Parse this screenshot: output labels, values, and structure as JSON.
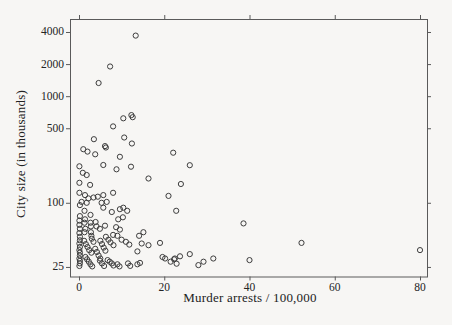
{
  "figure": {
    "x_axis_title": "Murder arrests / 100,000",
    "y_axis_title": "City size (in thousands)"
  },
  "chart_data": {
    "type": "scatter",
    "title": "",
    "xlabel": "Murder arrests / 100,000",
    "ylabel": "City size (in thousands)",
    "x_scale": "linear",
    "y_scale": "log",
    "xlim": [
      -2,
      82
    ],
    "ylim": [
      21,
      5300
    ],
    "xticks": [
      0,
      20,
      40,
      60,
      80
    ],
    "yticks": [
      25,
      100,
      500,
      1000,
      2000,
      4000
    ],
    "grid": false,
    "legend": "none",
    "marker": "open-circle",
    "ink_color": "#3d3d3d",
    "axis_color": "#5a5a5a",
    "background_color": "#f7f6f4",
    "points": [
      [
        13.3,
        3700
      ],
      [
        7.3,
        1900
      ],
      [
        4.6,
        1330
      ],
      [
        10.4,
        620
      ],
      [
        12.3,
        665
      ],
      [
        12.6,
        635
      ],
      [
        8.0,
        520
      ],
      [
        10.6,
        410
      ],
      [
        3.5,
        395
      ],
      [
        6.1,
        340
      ],
      [
        6.3,
        330
      ],
      [
        12.4,
        360
      ],
      [
        1.0,
        318
      ],
      [
        2.0,
        302
      ],
      [
        3.8,
        285
      ],
      [
        9.6,
        270
      ],
      [
        22.1,
        295
      ],
      [
        0.1,
        220
      ],
      [
        5.7,
        226
      ],
      [
        8.8,
        206
      ],
      [
        12.2,
        218
      ],
      [
        0.9,
        191
      ],
      [
        1.8,
        182
      ],
      [
        16.3,
        169
      ],
      [
        0.1,
        154
      ],
      [
        2.6,
        147
      ],
      [
        23.9,
        150
      ],
      [
        26.0,
        225
      ],
      [
        0.1,
        124
      ],
      [
        1.4,
        118
      ],
      [
        2.2,
        110
      ],
      [
        3.4,
        112
      ],
      [
        4.4,
        114
      ],
      [
        5.7,
        118
      ],
      [
        8.0,
        124
      ],
      [
        21.0,
        116
      ],
      [
        0.6,
        102
      ],
      [
        1.8,
        100
      ],
      [
        5.3,
        100
      ],
      [
        6.5,
        102
      ],
      [
        9.6,
        87
      ],
      [
        10.4,
        90
      ],
      [
        11.3,
        84
      ],
      [
        22.8,
        84
      ],
      [
        5.7,
        90
      ],
      [
        7.7,
        82
      ],
      [
        1.3,
        84
      ],
      [
        0.2,
        95
      ],
      [
        2.7,
        77
      ],
      [
        9.2,
        70
      ],
      [
        10.3,
        73
      ],
      [
        6.1,
        61
      ],
      [
        4.9,
        57
      ],
      [
        8.7,
        59
      ],
      [
        9.6,
        56
      ],
      [
        1.4,
        70
      ],
      [
        1.3,
        65
      ],
      [
        1.5,
        57
      ],
      [
        2.7,
        65
      ],
      [
        2.8,
        60
      ],
      [
        38.6,
        64
      ],
      [
        0.2,
        75
      ],
      [
        0.1,
        68
      ],
      [
        0.1,
        62
      ],
      [
        0.2,
        57
      ],
      [
        3.9,
        66
      ],
      [
        4.1,
        60
      ],
      [
        15.1,
        53
      ],
      [
        8.0,
        50
      ],
      [
        9.0,
        49
      ],
      [
        14.1,
        49
      ],
      [
        10.0,
        45
      ],
      [
        11.0,
        43
      ],
      [
        11.8,
        40.5
      ],
      [
        14.7,
        41.5
      ],
      [
        19.0,
        42
      ],
      [
        6.3,
        48
      ],
      [
        6.9,
        45
      ],
      [
        7.4,
        42.5
      ],
      [
        8.1,
        40
      ],
      [
        1.3,
        53
      ],
      [
        2.8,
        53
      ],
      [
        2.9,
        49
      ],
      [
        16.3,
        40
      ],
      [
        0.1,
        52
      ],
      [
        0.2,
        48
      ],
      [
        0.2,
        44.5
      ],
      [
        0.1,
        41.5
      ],
      [
        1.2,
        44
      ],
      [
        1.6,
        41
      ],
      [
        3.0,
        46
      ],
      [
        3.4,
        43
      ],
      [
        52.2,
        42
      ],
      [
        5.0,
        44
      ],
      [
        5.4,
        41
      ],
      [
        0.2,
        38.5
      ],
      [
        0.1,
        36
      ],
      [
        0.2,
        34
      ],
      [
        0.2,
        32
      ],
      [
        2.0,
        38.5
      ],
      [
        2.4,
        36
      ],
      [
        2.9,
        34
      ],
      [
        3.8,
        37
      ],
      [
        4.2,
        34.5
      ],
      [
        5.8,
        38
      ],
      [
        6.2,
        35.5
      ],
      [
        13.7,
        35
      ],
      [
        19.6,
        31
      ],
      [
        20.2,
        30
      ],
      [
        23.7,
        31.5
      ],
      [
        22.5,
        30
      ],
      [
        26.0,
        33
      ],
      [
        31.5,
        30
      ],
      [
        80,
        36
      ],
      [
        4.6,
        32
      ],
      [
        5.0,
        30
      ],
      [
        0.1,
        30
      ],
      [
        0.2,
        28.5
      ],
      [
        0.2,
        27
      ],
      [
        0.1,
        25.5
      ],
      [
        1.5,
        31
      ],
      [
        1.9,
        29.5
      ],
      [
        2.3,
        28
      ],
      [
        2.7,
        26.5
      ],
      [
        3.1,
        25.3
      ],
      [
        4.9,
        28.6
      ],
      [
        5.4,
        27
      ],
      [
        5.9,
        25.5
      ],
      [
        7.7,
        27
      ],
      [
        8.1,
        25.8
      ],
      [
        13.7,
        26.5
      ],
      [
        14.3,
        27.3
      ],
      [
        21.5,
        28
      ],
      [
        22.3,
        29.5
      ],
      [
        22.9,
        26.8
      ],
      [
        29.2,
        28
      ],
      [
        28.0,
        26
      ],
      [
        40.0,
        29
      ],
      [
        9.0,
        26.5
      ],
      [
        9.5,
        25.3
      ],
      [
        11.5,
        27
      ],
      [
        12.0,
        25.6
      ],
      [
        6.7,
        29
      ],
      [
        7.2,
        28
      ]
    ]
  }
}
